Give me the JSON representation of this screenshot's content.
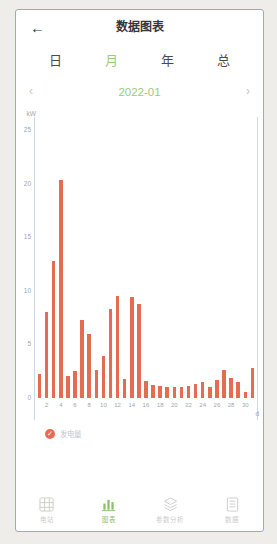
{
  "header": {
    "back_icon": "←",
    "title": "数据图表"
  },
  "tabs": [
    {
      "label": "日",
      "active": false
    },
    {
      "label": "月",
      "active": true
    },
    {
      "label": "年",
      "active": false
    },
    {
      "label": "总",
      "active": false
    }
  ],
  "date_nav": {
    "prev_icon": "‹",
    "value": "2022-01",
    "next_icon": "›"
  },
  "chart_data": {
    "type": "bar",
    "title": "",
    "ylabel": "kW",
    "xlabel": "d",
    "series_name": "发电量",
    "bar_color": "#e56b52",
    "ylim": [
      0,
      25
    ],
    "yticks": [
      0,
      5,
      10,
      15,
      20,
      25
    ],
    "xticks": [
      2,
      4,
      6,
      8,
      10,
      12,
      14,
      16,
      18,
      20,
      22,
      24,
      26,
      28,
      30
    ],
    "x": [
      1,
      2,
      3,
      4,
      5,
      6,
      7,
      8,
      9,
      10,
      11,
      12,
      13,
      14,
      15,
      16,
      17,
      18,
      19,
      20,
      21,
      22,
      23,
      24,
      25,
      26,
      27,
      28,
      29,
      30,
      31
    ],
    "values": [
      2.2,
      8.0,
      12.8,
      20.3,
      2.1,
      2.5,
      7.3,
      6.0,
      2.6,
      3.9,
      8.3,
      9.5,
      1.8,
      9.4,
      8.8,
      1.6,
      1.2,
      1.1,
      1.0,
      1.0,
      1.0,
      1.1,
      1.3,
      1.5,
      1.0,
      1.7,
      2.6,
      1.9,
      1.5,
      0.6,
      2.8
    ],
    "legend_position": "bottom-left",
    "grid": false
  },
  "legend": {
    "checked": true,
    "label": "发电量"
  },
  "bottom_nav": [
    {
      "label": "电站",
      "icon": "grid-icon",
      "active": false
    },
    {
      "label": "图表",
      "icon": "bar-chart-icon",
      "active": true
    },
    {
      "label": "参数分析",
      "icon": "layers-icon",
      "active": false
    },
    {
      "label": "数据",
      "icon": "document-icon",
      "active": false
    }
  ],
  "colors": {
    "accent_green": "#9dc97c",
    "nav_active_green": "#8fbf6a",
    "bar_coral": "#e56b52",
    "axis_text": "#9aa8b6",
    "axis_line": "#c9dae5",
    "border_blue": "#8cacd9"
  }
}
